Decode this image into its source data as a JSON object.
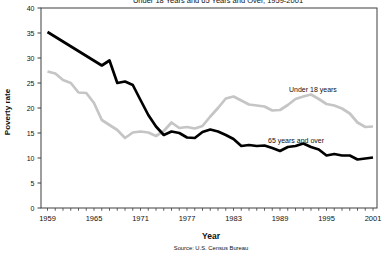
{
  "chart_data": {
    "type": "line",
    "title_clipped": "Under 18 Years and 65 Years and Over, 1959-2001",
    "xlabel": "Year",
    "ylabel": "Poverty rate",
    "source": "Source: U.S. Census Bureau",
    "xlim": [
      1959,
      2001
    ],
    "ylim": [
      0,
      40
    ],
    "grid": false,
    "legend_position": "inline-labels",
    "axis_color": "#3f3f3f",
    "label_color": "#333333",
    "y_tick_labels": [
      "0",
      "5",
      "10",
      "15",
      "20",
      "25",
      "30",
      "35",
      "40"
    ],
    "x_tick_labels": [
      "1959",
      "1965",
      "1971",
      "1977",
      "1983",
      "1989",
      "1995",
      "2001"
    ],
    "x": [
      1959,
      1960,
      1961,
      1962,
      1963,
      1964,
      1965,
      1966,
      1967,
      1968,
      1969,
      1970,
      1971,
      1972,
      1973,
      1974,
      1975,
      1976,
      1977,
      1978,
      1979,
      1980,
      1981,
      1982,
      1983,
      1984,
      1985,
      1986,
      1987,
      1988,
      1989,
      1990,
      1991,
      1992,
      1993,
      1994,
      1995,
      1996,
      1997,
      1998,
      1999,
      2000,
      2001
    ],
    "series": [
      {
        "id": "under-18-years",
        "name": "Under 18 years",
        "color": "#c5c5c5",
        "values": [
          27.3,
          26.9,
          25.6,
          25.0,
          23.1,
          23.0,
          21.0,
          17.6,
          16.6,
          15.6,
          14.0,
          15.1,
          15.3,
          15.1,
          14.4,
          15.4,
          17.1,
          16.0,
          16.2,
          15.9,
          16.4,
          18.3,
          20.0,
          21.9,
          22.3,
          21.5,
          20.7,
          20.5,
          20.3,
          19.5,
          19.6,
          20.6,
          21.8,
          22.3,
          22.7,
          21.8,
          20.8,
          20.5,
          19.9,
          18.9,
          17.1,
          16.2,
          16.3
        ]
      },
      {
        "id": "65-years-and-over",
        "name": "65 years and over",
        "color": "#000000",
        "values": [
          35.2,
          null,
          null,
          null,
          null,
          null,
          null,
          28.5,
          29.5,
          25.0,
          25.3,
          24.6,
          21.6,
          18.6,
          16.3,
          14.6,
          15.3,
          15.0,
          14.1,
          14.0,
          15.2,
          15.7,
          15.3,
          14.6,
          13.8,
          12.4,
          12.6,
          12.4,
          12.5,
          12.0,
          11.4,
          12.2,
          12.4,
          12.9,
          12.2,
          11.7,
          10.5,
          10.8,
          10.5,
          10.5,
          9.7,
          9.9,
          10.1
        ]
      }
    ]
  }
}
